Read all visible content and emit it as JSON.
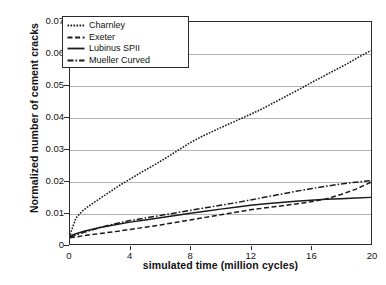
{
  "chart_data": {
    "type": "line",
    "title": "",
    "xlabel": "simulated time (million cycles)",
    "ylabel": "Normalized number of cement cracks",
    "xlim": [
      0,
      20
    ],
    "ylim": [
      0,
      0.07
    ],
    "xticks": [
      0,
      4,
      8,
      12,
      16,
      20
    ],
    "yticks": [
      0,
      0.01,
      0.02,
      0.03,
      0.04,
      0.05,
      0.06,
      0.07
    ],
    "ytick_labels": [
      "0",
      "0.01",
      "0.02",
      "0.03",
      "0.04",
      "0.05",
      "0.06",
      "0.07"
    ],
    "xtick_labels": [
      "0",
      "4",
      "8",
      "12",
      "16",
      "20"
    ],
    "grid": "horizontal",
    "legend_position": "upper-left-inside",
    "series": [
      {
        "name": "Charnley",
        "style": "dotted",
        "color": "#1a1a1a",
        "x": [
          0,
          0.4,
          0.8,
          1.2,
          1.6,
          2.0,
          2.6,
          3.2,
          4.0,
          4.8,
          5.6,
          6.4,
          7.2,
          8.0,
          8.8,
          9.6,
          10.4,
          11.2,
          12.0,
          12.8,
          13.6,
          14.4,
          15.2,
          16.0,
          16.8,
          17.6,
          18.4,
          19.2,
          20.0
        ],
        "y": [
          0.003,
          0.0082,
          0.0103,
          0.0118,
          0.0131,
          0.0144,
          0.0163,
          0.0182,
          0.0205,
          0.0228,
          0.0249,
          0.0272,
          0.0296,
          0.032,
          0.034,
          0.0358,
          0.0375,
          0.0392,
          0.0409,
          0.0427,
          0.0447,
          0.0467,
          0.0487,
          0.0508,
          0.0528,
          0.0548,
          0.0568,
          0.059,
          0.061
        ]
      },
      {
        "name": "Exeter",
        "style": "dashed",
        "color": "#1a1a1a",
        "x": [
          0,
          0.5,
          1.0,
          2.0,
          3.0,
          4.0,
          5.0,
          6.0,
          7.0,
          8.0,
          9.0,
          10.0,
          11.0,
          12.0,
          13.0,
          14.0,
          15.0,
          16.0,
          17.0,
          18.0,
          19.0,
          20.0
        ],
        "y": [
          0.002,
          0.0023,
          0.0027,
          0.0033,
          0.0039,
          0.0046,
          0.0053,
          0.006,
          0.0068,
          0.0076,
          0.0084,
          0.0092,
          0.01,
          0.0108,
          0.0114,
          0.012,
          0.0126,
          0.0133,
          0.0142,
          0.0156,
          0.0173,
          0.0195
        ]
      },
      {
        "name": "Lubinus SPII",
        "style": "solid",
        "color": "#1a1a1a",
        "x": [
          0,
          0.5,
          1.0,
          2.0,
          3.0,
          4.0,
          5.0,
          6.0,
          7.0,
          8.0,
          9.0,
          10.0,
          11.0,
          12.0,
          13.0,
          14.0,
          15.0,
          16.0,
          17.0,
          18.0,
          19.0,
          20.0
        ],
        "y": [
          0.0026,
          0.0034,
          0.0041,
          0.0052,
          0.0061,
          0.0069,
          0.0076,
          0.0083,
          0.009,
          0.0097,
          0.0103,
          0.011,
          0.0116,
          0.0122,
          0.0127,
          0.0131,
          0.0135,
          0.0138,
          0.0141,
          0.0143,
          0.0145,
          0.0147
        ]
      },
      {
        "name": "Mueller Curved",
        "style": "dashdot",
        "color": "#1a1a1a",
        "x": [
          0,
          0.5,
          1.0,
          2.0,
          3.0,
          4.0,
          5.0,
          6.0,
          7.0,
          8.0,
          9.0,
          10.0,
          11.0,
          12.0,
          13.0,
          14.0,
          15.0,
          16.0,
          17.0,
          18.0,
          19.0,
          20.0
        ],
        "y": [
          0.0022,
          0.003,
          0.0038,
          0.0052,
          0.0064,
          0.0074,
          0.0082,
          0.009,
          0.0098,
          0.0106,
          0.0114,
          0.0122,
          0.013,
          0.0139,
          0.0148,
          0.0157,
          0.0166,
          0.0174,
          0.0182,
          0.0189,
          0.0195,
          0.02
        ]
      }
    ]
  },
  "legend": {
    "items": [
      {
        "label": "Charnley"
      },
      {
        "label": "Exeter"
      },
      {
        "label": "Lubinus SPII"
      },
      {
        "label": "Mueller Curved"
      }
    ]
  }
}
